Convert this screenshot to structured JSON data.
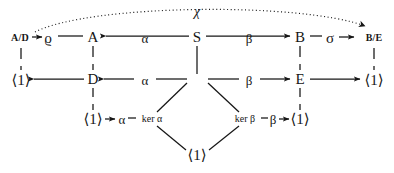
{
  "figure": {
    "kind": "commutative-diagram",
    "background_color": "#ffffff",
    "ink_color": "#161616"
  },
  "nodes": {
    "top_row": [
      {
        "id": "AD",
        "label": "A/D",
        "x": 20,
        "y": 38,
        "style": "obj-small"
      },
      {
        "id": "rho",
        "label": "ϱ",
        "x": 48,
        "y": 38,
        "style": "obj"
      },
      {
        "id": "A",
        "label": "A",
        "x": 93,
        "y": 37,
        "style": "obj"
      },
      {
        "id": "S",
        "label": "S",
        "x": 197,
        "y": 37,
        "style": "obj"
      },
      {
        "id": "B",
        "label": "B",
        "x": 300,
        "y": 37,
        "style": "obj"
      },
      {
        "id": "sigma",
        "label": "σ",
        "x": 330,
        "y": 38,
        "style": "obj"
      },
      {
        "id": "BE",
        "label": "B/E",
        "x": 374,
        "y": 38,
        "style": "obj-small"
      }
    ],
    "middle_row": [
      {
        "id": "one-left",
        "label": "⟨1⟩",
        "x": 21,
        "y": 80,
        "style": "trivial"
      },
      {
        "id": "D",
        "label": "D",
        "x": 93,
        "y": 79,
        "style": "obj"
      },
      {
        "id": "E",
        "label": "E",
        "x": 300,
        "y": 79,
        "style": "obj"
      },
      {
        "id": "one-right",
        "label": "⟨1⟩",
        "x": 374,
        "y": 80,
        "style": "trivial"
      }
    ],
    "lower_row": [
      {
        "id": "one-lower-left",
        "label": "⟨1⟩",
        "x": 93,
        "y": 119,
        "style": "trivial"
      },
      {
        "id": "one-lower-right",
        "label": "⟨1⟩",
        "x": 300,
        "y": 119,
        "style": "trivial"
      }
    ],
    "bottom": [
      {
        "id": "one-bottom",
        "label": "⟨1⟩",
        "x": 197,
        "y": 155,
        "style": "trivial"
      }
    ]
  },
  "map_labels": [
    {
      "id": "chi",
      "label": "χ",
      "x": 197,
      "y": 12,
      "style": "chi"
    },
    {
      "id": "alpha-top",
      "label": "α",
      "x": 145,
      "y": 38,
      "style": "maplabel"
    },
    {
      "id": "beta-top",
      "label": "β",
      "x": 249,
      "y": 38,
      "style": "maplabel"
    },
    {
      "id": "alpha-middle",
      "label": "α",
      "x": 145,
      "y": 80,
      "style": "maplabel"
    },
    {
      "id": "beta-middle",
      "label": "β",
      "x": 249,
      "y": 80,
      "style": "maplabel"
    },
    {
      "id": "alpha-lower",
      "label": "α",
      "x": 122,
      "y": 119,
      "style": "maplabel"
    },
    {
      "id": "ker-alpha",
      "label": "ker α",
      "x": 152,
      "y": 119,
      "style": "maplabel-small"
    },
    {
      "id": "ker-beta",
      "label": "ker β",
      "x": 245,
      "y": 119,
      "style": "maplabel-small"
    },
    {
      "id": "beta-lower",
      "label": "β",
      "x": 273,
      "y": 119,
      "style": "maplabel"
    }
  ],
  "edges": {
    "solid_horizontal": [
      {
        "name": "rho-to-AD",
        "arrow": "left"
      },
      {
        "name": "rho-to-A",
        "arrow": "none"
      },
      {
        "name": "S-to-A-alpha",
        "arrow": "left"
      },
      {
        "name": "S-to-B-beta",
        "arrow": "right"
      },
      {
        "name": "B-to-sigma",
        "arrow": "none"
      },
      {
        "name": "sigma-to-BE",
        "arrow": "right"
      },
      {
        "name": "D-to-one-left",
        "arrow": "left"
      },
      {
        "name": "alpha-to-D",
        "arrow": "left"
      },
      {
        "name": "beta-to-E",
        "arrow": "right"
      },
      {
        "name": "E-to-one-right",
        "arrow": "right"
      },
      {
        "name": "alpha-to-one-lower-left",
        "arrow": "left"
      },
      {
        "name": "beta-to-one-lower-right",
        "arrow": "right"
      }
    ],
    "dashed_vertical": [
      {
        "name": "AD-to-one-left"
      },
      {
        "name": "A-to-D"
      },
      {
        "name": "B-to-E"
      },
      {
        "name": "BE-to-one-right"
      },
      {
        "name": "D-to-one-lower-left"
      },
      {
        "name": "E-to-one-lower-right"
      }
    ],
    "solid_vertical": [
      {
        "name": "S-to-center"
      }
    ],
    "diagonal": [
      {
        "name": "alpha-row-to-ker-alpha"
      },
      {
        "name": "ker-alpha-to-one-bottom"
      },
      {
        "name": "beta-row-to-ker-beta"
      },
      {
        "name": "ker-beta-to-one-bottom"
      }
    ],
    "dotted_curve": [
      {
        "name": "chi-curve-AD-to-BE",
        "arrow": "right"
      }
    ]
  }
}
